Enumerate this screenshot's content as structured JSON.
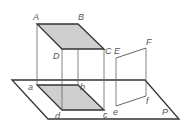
{
  "diagram": {
    "type": "orthogonal projection figure",
    "colors": {
      "line": "#333333",
      "thin_line": "#777777",
      "shade": "#c8c8c8",
      "label": "#555555"
    },
    "plane": {
      "label": "P",
      "points": [
        [
          12,
          80
        ],
        [
          145,
          80
        ],
        [
          179,
          119
        ],
        [
          48,
          119
        ]
      ]
    },
    "top_face": {
      "points": [
        [
          37,
          24
        ],
        [
          78,
          24
        ],
        [
          104,
          49
        ],
        [
          62,
          49
        ]
      ],
      "shaded": true
    },
    "bottom_face": {
      "points": [
        [
          37,
          85
        ],
        [
          78,
          85
        ],
        [
          104,
          110
        ],
        [
          62,
          110
        ]
      ],
      "shaded": true
    },
    "verticals": [
      {
        "from": "A",
        "to": "a"
      },
      {
        "from": "B",
        "to": "b"
      },
      {
        "from": "C",
        "to": "c"
      },
      {
        "from": "D",
        "to": "d"
      },
      {
        "from": "E",
        "to": "e"
      },
      {
        "from": "F",
        "to": "f"
      }
    ],
    "segment_EF": {
      "points": [
        [
          116,
          58
        ],
        [
          146,
          48
        ]
      ]
    },
    "segment_ef": {
      "points": [
        [
          116,
          106
        ],
        [
          146,
          96
        ]
      ]
    },
    "labels": {
      "A": "A",
      "B": "B",
      "C": "C",
      "D": "D",
      "E": "E",
      "F": "F",
      "a": "a",
      "b": "b",
      "c": "c",
      "d": "d",
      "e": "e",
      "f": "f",
      "P": "P"
    }
  }
}
